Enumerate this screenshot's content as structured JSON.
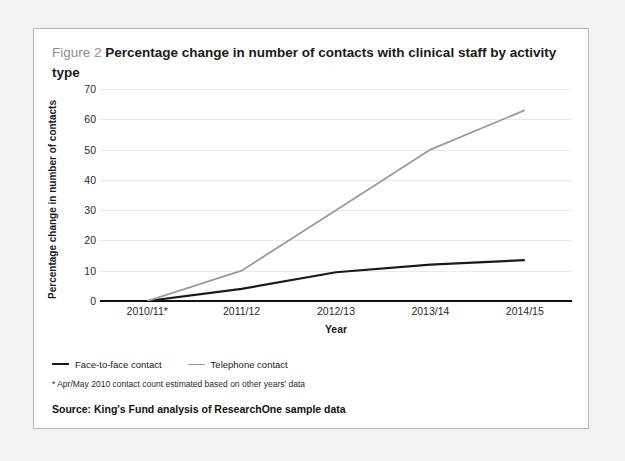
{
  "figure": {
    "label": "Figure 2",
    "title": "Percentage change in number of contacts with clinical staff by activity type",
    "footnote": "* Apr/May 2010 contact count estimated based on other years' data",
    "source": "Source: King's Fund analysis of ResearchOne sample data"
  },
  "colors": {
    "face_to_face": "#1a1a1a",
    "telephone": "#9a9a9a",
    "axis": "#111111",
    "gridline": "#e9e9e9",
    "card_background": "#ffffff",
    "page_background": "#f2f2f1",
    "card_border": "#b9b9b9",
    "label_gray": "#8d8d8d"
  },
  "chart_data": {
    "type": "line",
    "title": "Percentage change in number of contacts with clinical staff by activity type",
    "xlabel": "Year",
    "ylabel": "Percentage change in number of contacts",
    "categories": [
      "2010/11*",
      "2011/12",
      "2012/13",
      "2013/14",
      "2014/15"
    ],
    "series": [
      {
        "name": "Face-to-face contact",
        "color": "#1a1a1a",
        "values": [
          0,
          4,
          9.5,
          12,
          13.5
        ]
      },
      {
        "name": "Telephone contact",
        "color": "#9a9a9a",
        "values": [
          0,
          10,
          30,
          50,
          63
        ]
      }
    ],
    "ylim": [
      0,
      70
    ],
    "yticks": [
      0,
      10,
      20,
      30,
      40,
      50,
      60,
      70
    ],
    "grid": true,
    "legend_position": "bottom-left"
  }
}
